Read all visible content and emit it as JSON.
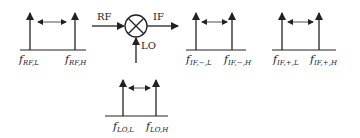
{
  "diagram": {
    "mixer": {
      "input_label": "RF",
      "output_label": "IF",
      "lo_label": "LO",
      "symbol": "mixer-cross-circle"
    },
    "spectra": [
      {
        "name": "rf",
        "low": {
          "f": "f",
          "sub": "RF,L"
        },
        "high": {
          "f": "f",
          "sub": "RF,H"
        }
      },
      {
        "name": "if-minus",
        "low": {
          "f": "f",
          "sub": "IF,−,L"
        },
        "high": {
          "f": "f",
          "sub": "IF,−,H"
        }
      },
      {
        "name": "if-plus",
        "low": {
          "f": "f",
          "sub": "IF,+,L"
        },
        "high": {
          "f": "f",
          "sub": "IF,+,H"
        }
      },
      {
        "name": "lo",
        "low": {
          "f": "f",
          "sub": "LO,L"
        },
        "high": {
          "f": "f",
          "sub": "LO,H"
        }
      }
    ]
  }
}
